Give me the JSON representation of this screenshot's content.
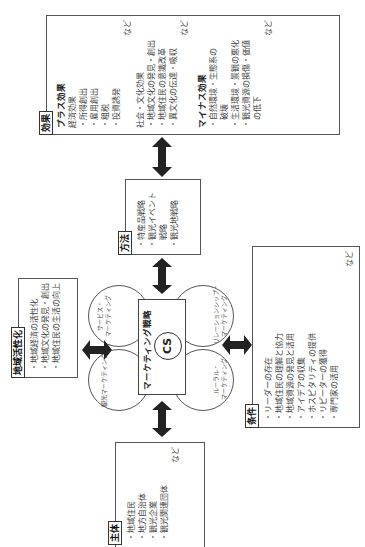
{
  "effects": {
    "tag": "効果",
    "plus": {
      "title": "プラス効果",
      "economic": {
        "title": "経済効果",
        "items": [
          "・所得創出",
          "・雇用創出",
          "・租税",
          "・投資誘発"
        ],
        "etc": "など"
      },
      "social": {
        "title": "社会・文化効果",
        "items": [
          "・地域文化の発見・創出",
          "・地域住民の意識改革",
          "・異文化の伝達・吸収"
        ],
        "etc": "など"
      }
    },
    "minus": {
      "title": "マイナス効果",
      "items": [
        "・自然環境・生態系の",
        "　破壊",
        "・生活環境・景観の悪化",
        "・観光資源の損傷・価値",
        "　の低下"
      ],
      "etc": "など"
    }
  },
  "method": {
    "tag": "方法",
    "items": [
      "・特産品戦略",
      "・観光イベント",
      "　戦略",
      "・観光地戦略"
    ]
  },
  "center": {
    "title": "マーケティング戦略",
    "cs": "CS",
    "petals": {
      "top_left": "サービス・\nマーケティング",
      "top_right": "リレーションシップ・\nマーケティング",
      "bottom_left": "観光マーケティング",
      "bottom_right": "ルーラル・\nマーケティング"
    }
  },
  "revitalization": {
    "tag": "地域活性化",
    "items": [
      "・地域経済の活性化",
      "・地域文化の発見・創出",
      "・地域住民の生活の向上"
    ]
  },
  "conditions": {
    "tag": "条件",
    "items": [
      "・リーダーの存在",
      "・地域住民の理解と協力",
      "・地域資源の発見と活用",
      "・アイデアの収集",
      "・ホスピタリティの提供",
      "・リピーターの獲得",
      "・専門家の活用"
    ],
    "etc": "など"
  },
  "actors": {
    "tag": "主体",
    "items": [
      "・地域住民",
      "・地方自治体",
      "・観光企業",
      "・観光関連団体"
    ],
    "etc": "など"
  }
}
